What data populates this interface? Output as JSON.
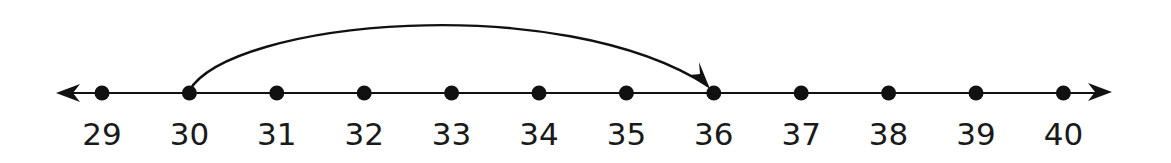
{
  "number_line": {
    "start": 29,
    "end": 40,
    "labels": [
      "29",
      "30",
      "31",
      "32",
      "33",
      "34",
      "35",
      "36",
      "37",
      "38",
      "39",
      "40"
    ],
    "both_ends_arrowed": true
  },
  "jump": {
    "from": 30,
    "to": 36,
    "size": 6,
    "direction": "right"
  },
  "colors": {
    "line": "#111111",
    "background": "#ffffff"
  }
}
